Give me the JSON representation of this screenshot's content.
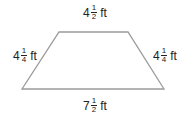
{
  "shape": "trapezoid",
  "stroke_color": "#9a9a9a",
  "vertices": [
    [
      59,
      32
    ],
    [
      128,
      32
    ],
    [
      164,
      89
    ],
    [
      22,
      89
    ]
  ],
  "labels": {
    "top": {
      "whole": "4",
      "num": "1",
      "den": "2",
      "unit": "ft"
    },
    "left": {
      "whole": "4",
      "num": "1",
      "den": "4",
      "unit": "ft"
    },
    "right": {
      "whole": "4",
      "num": "1",
      "den": "4",
      "unit": "ft"
    },
    "bottom": {
      "whole": "7",
      "num": "1",
      "den": "2",
      "unit": "ft"
    }
  }
}
